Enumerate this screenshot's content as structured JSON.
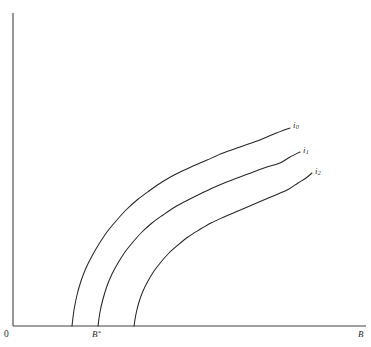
{
  "figure": {
    "background_color": "#ffffff",
    "line_color": "#262626",
    "axis_color": "#404040"
  },
  "axes": {
    "origin_label": "0",
    "x_axis_label": "B",
    "y_axis_label": "",
    "x_tick_label": "B",
    "x_tick_superscript": "*"
  },
  "curve_labels": {
    "curve0_base": "i",
    "curve0_sub": "0",
    "curve1_base": "i",
    "curve1_sub": "1",
    "curve2_base": "i",
    "curve2_sub": "2"
  },
  "chart_data": {
    "type": "line",
    "title": "",
    "xlabel": "B",
    "ylabel": "",
    "grid": false,
    "legend": "inline-right-end-labels",
    "xlim": [
      0,
      1
    ],
    "ylim": [
      0,
      1
    ],
    "axis_pixel_box": {
      "x0": 13,
      "y0": 326,
      "x1": 366,
      "y1": 13
    },
    "x_annotations": [
      {
        "label": "B*",
        "x_pixel": 98,
        "value_note": "B-star, intercept of curve i1"
      }
    ],
    "series": [
      {
        "name": "i0",
        "label": "i₀",
        "x_intercept_pixel": 72,
        "end_pixel": [
          290,
          128
        ],
        "points_pixel": [
          [
            72,
            326
          ],
          [
            74,
            310
          ],
          [
            77,
            295
          ],
          [
            81,
            281
          ],
          [
            86,
            268
          ],
          [
            92,
            256
          ],
          [
            99,
            244
          ],
          [
            107,
            232
          ],
          [
            116,
            221
          ],
          [
            126,
            210
          ],
          [
            137,
            200
          ],
          [
            149,
            191
          ],
          [
            162,
            182
          ],
          [
            176,
            174
          ],
          [
            191,
            167
          ],
          [
            207,
            160
          ],
          [
            223,
            153
          ],
          [
            240,
            147
          ],
          [
            257,
            141
          ],
          [
            274,
            134
          ],
          [
            290,
            128
          ]
        ]
      },
      {
        "name": "i1",
        "label": "i₁",
        "x_intercept_pixel": 98,
        "end_pixel": [
          300,
          152
        ],
        "points_pixel": [
          [
            98,
            326
          ],
          [
            100,
            312
          ],
          [
            103,
            299
          ],
          [
            107,
            286
          ],
          [
            112,
            274
          ],
          [
            118,
            263
          ],
          [
            125,
            252
          ],
          [
            133,
            242
          ],
          [
            142,
            232
          ],
          [
            152,
            223
          ],
          [
            163,
            215
          ],
          [
            175,
            207
          ],
          [
            188,
            200
          ],
          [
            202,
            193
          ],
          [
            217,
            186
          ],
          [
            232,
            180
          ],
          [
            248,
            174
          ],
          [
            264,
            168
          ],
          [
            280,
            163
          ],
          [
            290,
            157
          ],
          [
            300,
            152
          ]
        ]
      },
      {
        "name": "i2",
        "label": "i₂",
        "x_intercept_pixel": 134,
        "end_pixel": [
          312,
          173
        ],
        "points_pixel": [
          [
            134,
            326
          ],
          [
            136,
            314
          ],
          [
            139,
            302
          ],
          [
            143,
            291
          ],
          [
            148,
            281
          ],
          [
            154,
            271
          ],
          [
            161,
            262
          ],
          [
            169,
            253
          ],
          [
            178,
            245
          ],
          [
            188,
            237
          ],
          [
            199,
            230
          ],
          [
            211,
            223
          ],
          [
            224,
            217
          ],
          [
            238,
            211
          ],
          [
            252,
            205
          ],
          [
            266,
            199
          ],
          [
            278,
            194
          ],
          [
            289,
            189
          ],
          [
            298,
            183
          ],
          [
            306,
            178
          ],
          [
            312,
            173
          ]
        ]
      }
    ]
  }
}
